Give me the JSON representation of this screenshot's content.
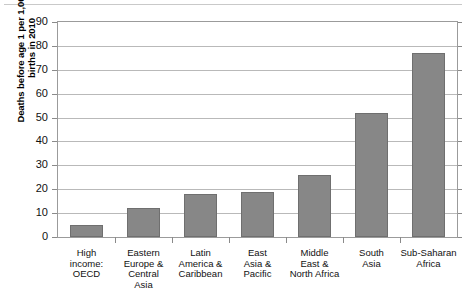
{
  "chart_data": {
    "type": "bar",
    "title": "",
    "xlabel": "",
    "ylabel": "Deaths before age 1 per 1,000 live births in 2010",
    "ylabel_lines": [
      "Deaths before age 1 per 1,000 live",
      "births in 2010"
    ],
    "categories": [
      "High income: OECD",
      "Eastern Europe & Central Asia",
      "Latin America & Caribbean",
      "East Asia & Pacific",
      "Middle East & North Africa",
      "South Asia",
      "Sub-Saharan Africa"
    ],
    "category_lines": [
      [
        "High",
        "income:",
        "OECD"
      ],
      [
        "Eastern",
        "Europe &",
        "Central",
        "Asia"
      ],
      [
        "Latin",
        "America &",
        "Caribbean"
      ],
      [
        "East",
        "Asia &",
        "Pacific"
      ],
      [
        "Middle",
        "East &",
        "North Africa"
      ],
      [
        "South",
        "Asia"
      ],
      [
        "Sub-Saharan",
        "Africa"
      ]
    ],
    "values": [
      5,
      12,
      18,
      19,
      26,
      52,
      77
    ],
    "ylim": [
      0,
      90
    ],
    "ytick_step": 10,
    "ytick_labels": [
      "0",
      "10",
      "20",
      "30",
      "40",
      "50",
      "60",
      "70",
      "80",
      "90"
    ],
    "grid": true,
    "legend": false,
    "bar_color": "#878787",
    "bar_border_color": "#6f6f6f",
    "gridline_color": "#b9b9b9",
    "axis_color": "#9b9b9b",
    "background_color": "#ffffff"
  }
}
